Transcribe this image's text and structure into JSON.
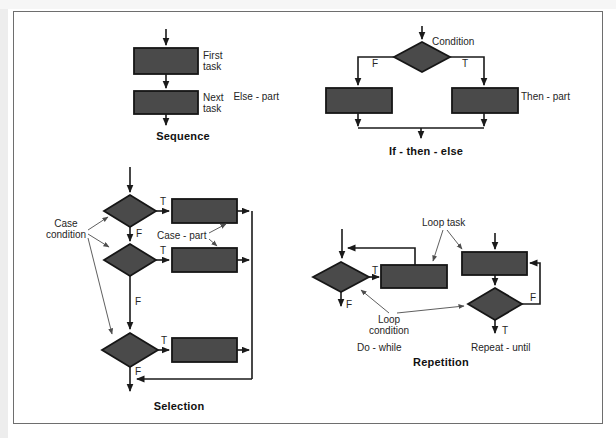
{
  "sequence": {
    "title": "Sequence",
    "first_task": "First\ntask",
    "next_task": "Next\ntask"
  },
  "if_then_else": {
    "title": "If - then - else",
    "condition": "Condition",
    "true_label": "T",
    "false_label": "F",
    "else_part": "Else - part",
    "then_part": "Then - part"
  },
  "selection": {
    "title": "Selection",
    "case_condition": "Case\ncondition",
    "case_part": "Case - part",
    "true_label": "T",
    "false_label": "F"
  },
  "repetition": {
    "title": "Repetition",
    "loop_task": "Loop task",
    "loop_condition": "Loop\ncondition",
    "do_while_label": "Do - while",
    "repeat_until_label": "Repeat - until",
    "true_label": "T",
    "false_label": "F"
  },
  "colors": {
    "shape_fill": "#4a4a4a",
    "shape_border": "#161616",
    "line": "#1a1a1a",
    "thin_line": "#4d4d4d",
    "frame_border": "#6e6e6e",
    "label": "#252525",
    "title": "#111111"
  }
}
